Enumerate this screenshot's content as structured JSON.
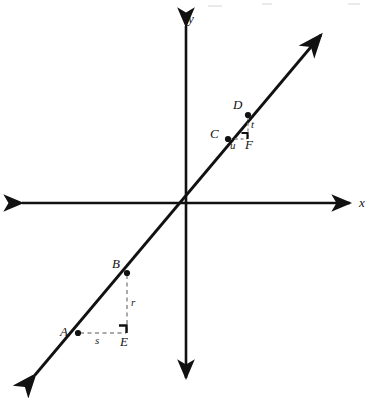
{
  "figure": {
    "background_color": "#ffffff",
    "ink_color": "#111111",
    "dash_color": "#999999",
    "width": 382,
    "height": 398
  },
  "axes": {
    "x_label": "x",
    "y_label": "y",
    "origin": {
      "x": 186,
      "y": 203
    },
    "x_axis": {
      "x1": 20,
      "y1": 203,
      "x2": 352,
      "y2": 203,
      "arrow_start": true,
      "arrow_end": true
    },
    "y_axis": {
      "x1": 186,
      "y1": 24,
      "x2": 186,
      "y2": 380,
      "arrow_start": true,
      "arrow_end": true
    }
  },
  "line": {
    "name": "slope-line",
    "x1": 33,
    "y1": 377,
    "x2": 323,
    "y2": 33,
    "arrow_start": true,
    "arrow_end": true
  },
  "points": [
    {
      "id": "A",
      "label": "A",
      "x": 78,
      "y": 333,
      "label_x": 60,
      "label_y": 326
    },
    {
      "id": "B",
      "label": "B",
      "x": 127,
      "y": 273,
      "label_x": 112,
      "label_y": 258
    },
    {
      "id": "E",
      "label": "E",
      "x": 127,
      "y": 333,
      "label_x": 120,
      "label_y": 336
    },
    {
      "id": "C",
      "label": "C",
      "x": 228,
      "y": 139,
      "label_x": 211,
      "label_y": 128
    },
    {
      "id": "D",
      "label": "D",
      "x": 248,
      "y": 115,
      "label_x": 234,
      "label_y": 99
    },
    {
      "id": "F",
      "label": "F",
      "x": 248,
      "y": 139,
      "label_x": 245,
      "label_y": 140
    }
  ],
  "segments": [
    {
      "id": "s",
      "label": "s",
      "from": "A",
      "to": "E",
      "style": "dashed",
      "orientation": "horizontal",
      "label_x": 96,
      "label_y": 336
    },
    {
      "id": "r",
      "label": "r",
      "from": "E",
      "to": "B",
      "style": "dashed",
      "orientation": "vertical",
      "label_x": 131,
      "label_y": 298
    },
    {
      "id": "u",
      "label": "u",
      "from": "C",
      "to": "F",
      "style": "dashed",
      "orientation": "horizontal",
      "label_x": 231,
      "label_y": 142
    },
    {
      "id": "t",
      "label": "t",
      "from": "F",
      "to": "D",
      "style": "dashed",
      "orientation": "vertical",
      "label_x": 251,
      "label_y": 121
    }
  ],
  "right_angle_marks": [
    {
      "id": "angle-at-E",
      "vertex": "E",
      "x": 127,
      "y": 333,
      "size": 8
    },
    {
      "id": "angle-at-F",
      "vertex": "F",
      "x": 248,
      "y": 139,
      "size": 6
    }
  ],
  "triangles": [
    {
      "id": "triangle-ABE",
      "vertices": [
        "A",
        "B",
        "E"
      ],
      "legs": [
        "s",
        "r"
      ]
    },
    {
      "id": "triangle-CDF",
      "vertices": [
        "C",
        "D",
        "F"
      ],
      "legs": [
        "u",
        "t"
      ]
    }
  ]
}
